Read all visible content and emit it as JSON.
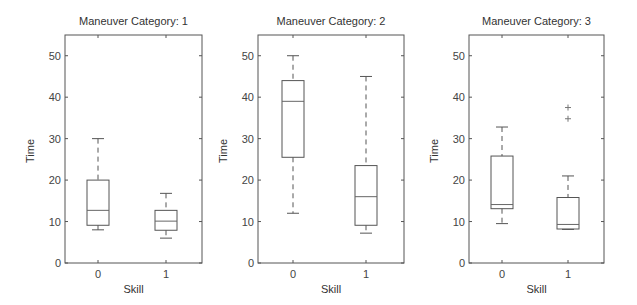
{
  "chart_data": [
    {
      "type": "boxplot",
      "title": "Maneuver Category: 1",
      "xlabel": "Skill",
      "ylabel": "Time",
      "categories": [
        "0",
        "1"
      ],
      "ylim": [
        0,
        55
      ],
      "yticks": [
        0,
        10,
        20,
        30,
        40,
        50
      ],
      "grid": false,
      "series": [
        {
          "name": "0",
          "whisker_low": 8,
          "q1": 9.1,
          "median": 12.7,
          "q3": 20,
          "whisker_high": 30,
          "outliers": []
        },
        {
          "name": "1",
          "whisker_low": 6,
          "q1": 7.9,
          "median": 10.1,
          "q3": 12.7,
          "whisker_high": 16.8,
          "outliers": []
        }
      ]
    },
    {
      "type": "boxplot",
      "title": "Maneuver Category: 2",
      "xlabel": "Skill",
      "ylabel": "Time",
      "categories": [
        "0",
        "1"
      ],
      "ylim": [
        0,
        55
      ],
      "yticks": [
        0,
        10,
        20,
        30,
        40,
        50
      ],
      "grid": false,
      "series": [
        {
          "name": "0",
          "whisker_low": 12,
          "q1": 25.5,
          "median": 39,
          "q3": 44,
          "whisker_high": 50,
          "outliers": []
        },
        {
          "name": "1",
          "whisker_low": 7.2,
          "q1": 9.1,
          "median": 16,
          "q3": 23.5,
          "whisker_high": 45,
          "outliers": []
        }
      ]
    },
    {
      "type": "boxplot",
      "title": "Maneuver Category: 3",
      "xlabel": "Skill",
      "ylabel": "Time",
      "categories": [
        "0",
        "1"
      ],
      "ylim": [
        0,
        55
      ],
      "yticks": [
        0,
        10,
        20,
        30,
        40,
        50
      ],
      "grid": false,
      "series": [
        {
          "name": "0",
          "whisker_low": 9.5,
          "q1": 13.1,
          "median": 14.1,
          "q3": 25.8,
          "whisker_high": 32.8,
          "outliers": []
        },
        {
          "name": "1",
          "whisker_low": 8.1,
          "q1": 8.2,
          "median": 9.3,
          "q3": 15.8,
          "whisker_high": 21,
          "outliers": [
            34.8,
            37.5
          ]
        }
      ]
    }
  ],
  "layout": {
    "panels": [
      {
        "left": 65,
        "right": 202,
        "top": 35,
        "bottom": 263,
        "xpos": [
          98,
          166
        ]
      },
      {
        "left": 258,
        "right": 404,
        "top": 35,
        "bottom": 263,
        "xpos": [
          293,
          366
        ]
      },
      {
        "left": 469,
        "right": 604,
        "top": 35,
        "bottom": 263,
        "xpos": [
          502,
          568
        ]
      }
    ],
    "box_half_width": 11,
    "cap_half_width": 6
  }
}
